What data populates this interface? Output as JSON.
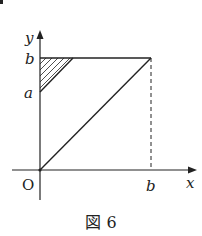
{
  "figure": {
    "caption": "図 6",
    "labels": {
      "x_axis": "x",
      "y_axis": "y",
      "origin": "O",
      "y_b": "b",
      "y_a": "a",
      "x_b": "b"
    }
  },
  "colors": {
    "ink": "#222222",
    "background": "#ffffff"
  },
  "geometry": {
    "origin": [
      40,
      170
    ],
    "point_b_on_y": [
      40,
      58
    ],
    "point_a_on_y": [
      40,
      92
    ],
    "corner_bb": [
      151,
      58
    ],
    "point_b_on_x": [
      151,
      170
    ],
    "shaded_triangle": [
      [
        40,
        58
      ],
      [
        73,
        58
      ],
      [
        40,
        92
      ]
    ]
  }
}
